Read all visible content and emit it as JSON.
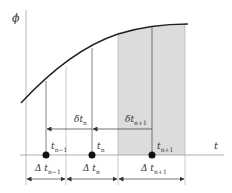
{
  "axes": {
    "y_label": "ϕ",
    "x_label": "t"
  },
  "points": [
    {
      "label": "t",
      "sub": "n−1"
    },
    {
      "label": "t",
      "sub": "n"
    },
    {
      "label": "t",
      "sub": "n+1"
    }
  ],
  "delta_small": [
    {
      "label": "δt",
      "sub": "n"
    },
    {
      "label": "δt",
      "sub": "n+1"
    }
  ],
  "delta_big": [
    {
      "label": "Δ t",
      "sub": "n−1"
    },
    {
      "label": "Δ t",
      "sub": "n"
    },
    {
      "label": "Δ t",
      "sub": "n+1"
    }
  ],
  "colors": {
    "shade": "#dcdcdc",
    "curve": "#222222",
    "grid": "#999999"
  }
}
